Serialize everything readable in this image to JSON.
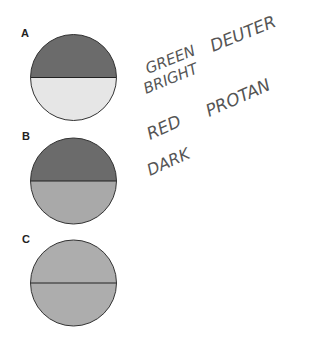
{
  "panels": [
    {
      "label": "A",
      "top_color": "#6b6b6b",
      "bottom_color": "#e6e6e6"
    },
    {
      "label": "B",
      "top_color": "#6b6b6b",
      "bottom_color": "#a9a9a9"
    },
    {
      "label": "C",
      "top_color": "#adadad",
      "bottom_color": "#adadad"
    }
  ],
  "annotations": {
    "line1_a": "GREEN",
    "line1_b": "BRIGHT",
    "line1_c": "DEUTER",
    "line2_a": "RED",
    "line2_b": "DARK",
    "line2_c": "PROTAN"
  }
}
